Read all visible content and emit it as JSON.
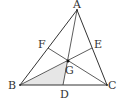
{
  "figure": {
    "type": "triangle-medians",
    "points": {
      "A": {
        "label": "A",
        "x": 77,
        "y": 10
      },
      "B": {
        "label": "B",
        "x": 20,
        "y": 85
      },
      "C": {
        "label": "C",
        "x": 107,
        "y": 85
      },
      "D": {
        "label": "D",
        "x": 63,
        "y": 85
      },
      "E": {
        "label": "E",
        "x": 92,
        "y": 48
      },
      "F": {
        "label": "F",
        "x": 48,
        "y": 48
      },
      "G": {
        "label": "G",
        "x": 68,
        "y": 61
      }
    },
    "shaded_region": [
      "B",
      "G",
      "D"
    ],
    "colors": {
      "line": "#333333",
      "shade": "#e6e6e6"
    }
  }
}
